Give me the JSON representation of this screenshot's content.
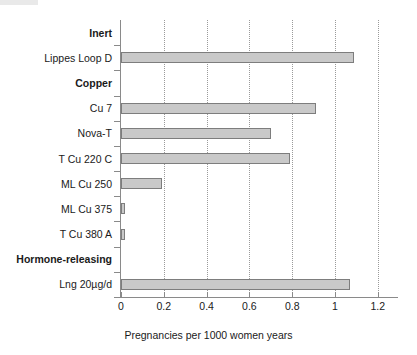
{
  "chart_data": {
    "type": "bar",
    "orientation": "horizontal",
    "title": "",
    "subtitle": "",
    "xlabel": "Pregnancies per 1000 women years",
    "ylabel": "",
    "xlim": [
      0,
      1.25
    ],
    "xticks": [
      0,
      0.2,
      0.4,
      0.6,
      0.8,
      1,
      1.2
    ],
    "xticklabels": [
      "0",
      "0.2",
      "0.4",
      "0.6",
      "0.8",
      "1",
      "1.2"
    ],
    "grid": "vertical-dotted",
    "legend": "none",
    "bar_color": "#c9c9c9",
    "bar_edge_color": "#7d7d7d",
    "rows": [
      {
        "label": "Inert",
        "is_group": true,
        "value": null
      },
      {
        "label": "Lippes Loop D",
        "is_group": false,
        "value": 1.09
      },
      {
        "label": "Copper",
        "is_group": true,
        "value": null
      },
      {
        "label": "Cu 7",
        "is_group": false,
        "value": 0.91
      },
      {
        "label": "Nova-T",
        "is_group": false,
        "value": 0.7
      },
      {
        "label": "T Cu 220 C",
        "is_group": false,
        "value": 0.79
      },
      {
        "label": "ML Cu 250",
        "is_group": false,
        "value": 0.19
      },
      {
        "label": "ML Cu 375",
        "is_group": false,
        "value": 0.02
      },
      {
        "label": "T Cu 380 A",
        "is_group": false,
        "value": 0.02
      },
      {
        "label": "Hormone-releasing",
        "is_group": true,
        "value": null
      },
      {
        "label": "Lng 20µg/d",
        "is_group": false,
        "value": 1.07
      }
    ],
    "categories": [
      "Lippes Loop D",
      "Cu 7",
      "Nova-T",
      "T Cu 220 C",
      "ML Cu 250",
      "ML Cu 375",
      "T Cu 380 A",
      "Lng 20µg/d"
    ],
    "values": [
      1.09,
      0.91,
      0.7,
      0.79,
      0.19,
      0.02,
      0.02,
      1.07
    ],
    "groups": [
      "Inert",
      "Copper",
      "Hormone-releasing"
    ]
  }
}
